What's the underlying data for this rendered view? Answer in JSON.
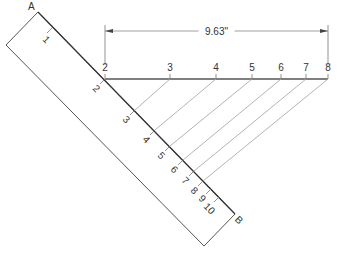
{
  "diagram": {
    "colors": {
      "rule_outline": "#555555",
      "rule_edge": "#333333",
      "line": "#555555",
      "construction": "#aaaaaa",
      "text": "#333333"
    },
    "rule": {
      "end_a_label": "A",
      "end_b_label": "B",
      "corners": {
        "top": [
          38,
          12
        ],
        "left": [
          6,
          45
        ],
        "bottom": [
          204,
          246
        ],
        "right": [
          235,
          214
        ]
      },
      "ticks": [
        {
          "label": "1",
          "pos": [
            52,
            28
          ],
          "label_pos": [
            44,
            42
          ]
        },
        {
          "label": "2",
          "pos": [
            105,
            79
          ],
          "label_pos": [
            94,
            91
          ]
        },
        {
          "label": "3",
          "pos": [
            135,
            110
          ],
          "label_pos": [
            124,
            122
          ]
        },
        {
          "label": "4",
          "pos": [
            155,
            130
          ],
          "label_pos": [
            144,
            142
          ]
        },
        {
          "label": "5",
          "pos": [
            170,
            146
          ],
          "label_pos": [
            159,
            158
          ]
        },
        {
          "label": "6",
          "pos": [
            183,
            160
          ],
          "label_pos": [
            172,
            172
          ]
        },
        {
          "label": "7",
          "pos": [
            194,
            171
          ],
          "label_pos": [
            183,
            183
          ]
        },
        {
          "label": "8",
          "pos": [
            203,
            181
          ],
          "label_pos": [
            192,
            193
          ]
        },
        {
          "label": "9",
          "pos": [
            211,
            189
          ],
          "label_pos": [
            200,
            201
          ]
        },
        {
          "label": "10",
          "pos": [
            219,
            197
          ],
          "label_pos": [
            207,
            211
          ]
        }
      ]
    },
    "line": {
      "y": 79,
      "points": [
        {
          "label": "2",
          "x": 105
        },
        {
          "label": "3",
          "x": 170
        },
        {
          "label": "4",
          "x": 216
        },
        {
          "label": "5",
          "x": 252
        },
        {
          "label": "6",
          "x": 281
        },
        {
          "label": "7",
          "x": 306
        },
        {
          "label": "8",
          "x": 328
        }
      ]
    },
    "dimension": {
      "text": "9.63\"",
      "y": 31,
      "x_start": 105,
      "x_end": 328
    },
    "construction_lines": [
      {
        "from_rule": "3",
        "to_line": "3"
      },
      {
        "from_rule": "4",
        "to_line": "4"
      },
      {
        "from_rule": "5",
        "to_line": "5"
      },
      {
        "from_rule": "6",
        "to_line": "6"
      },
      {
        "from_rule": "7",
        "to_line": "7"
      },
      {
        "from_rule": "8",
        "to_line": "8"
      }
    ]
  }
}
